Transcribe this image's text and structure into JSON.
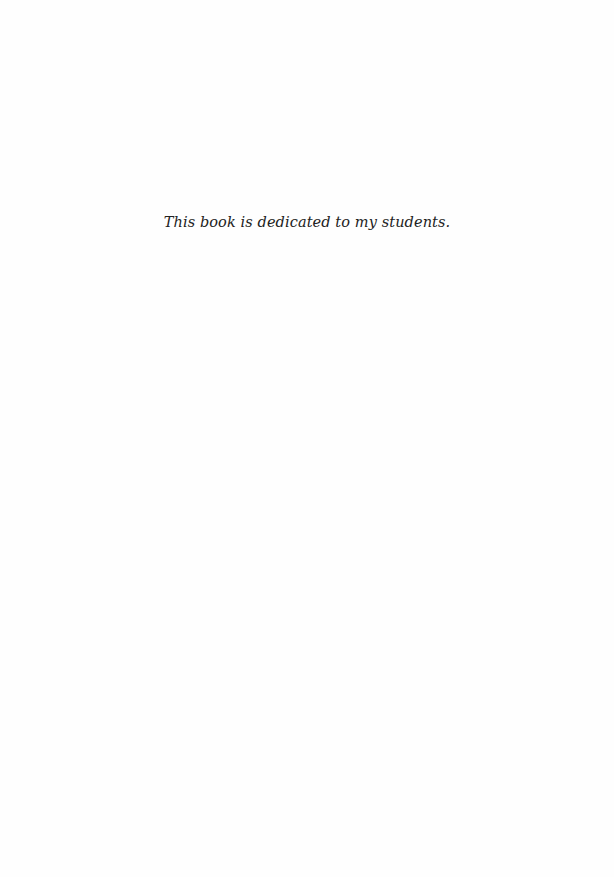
{
  "page": {
    "dedication": "This book is dedicated to my students.",
    "colors": {
      "background": "#fefefe",
      "text": "#222222"
    }
  }
}
